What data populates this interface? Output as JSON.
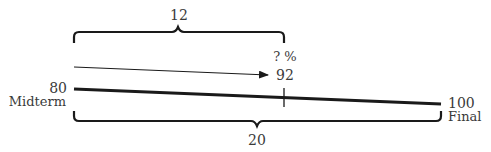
{
  "diagram": {
    "top_brace": {
      "label": "12"
    },
    "bottom_brace": {
      "label": "20"
    },
    "unknown": {
      "percent_label": "? %",
      "value": "92"
    },
    "midterm": {
      "value": "80",
      "label": "Midterm"
    },
    "final": {
      "value": "100",
      "label": "Final"
    },
    "colors": {
      "stroke": "#1a1a1a",
      "text": "#3a3a3a"
    }
  }
}
